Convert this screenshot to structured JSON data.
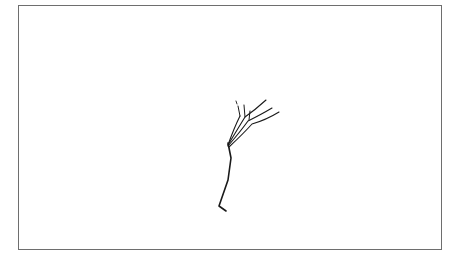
{
  "figure": {
    "frame": {
      "border_color": "#6e6e6e",
      "background": "#ffffff"
    },
    "sketch": {
      "subject": "line-drawing",
      "stroke_color": "#1a1a1a"
    }
  }
}
